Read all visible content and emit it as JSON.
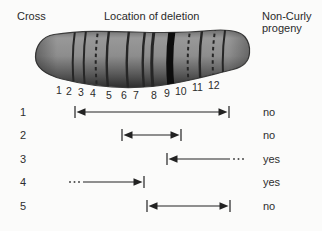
{
  "figure": {
    "background": "#fbfbfa",
    "ink": "#222222"
  },
  "headers": {
    "cross": "Cross",
    "location": "Location of deletion",
    "progeny": "Non-Curly\nprogeny"
  },
  "chromosome": {
    "outline_color": "#3c3c3c",
    "fill_top": "#989898",
    "fill_mid": "#8d8d8d",
    "fill_bottom": "#343434",
    "band_color": "#262626",
    "heavy_band_color": "#0d0d0d",
    "bands": [
      {
        "label": "1",
        "x": 74,
        "style": "solid",
        "width": 2,
        "label_x": 56,
        "label_y": 94
      },
      {
        "label": "2",
        "x": 85,
        "style": "solid",
        "width": 2,
        "label_x": 66,
        "label_y": 95
      },
      {
        "label": "3",
        "x": 97,
        "style": "dashed",
        "width": 2,
        "label_x": 78,
        "label_y": 96
      },
      {
        "label": "4",
        "x": 108,
        "style": "solid",
        "width": 2.4,
        "label_x": 90,
        "label_y": 97
      },
      {
        "label": "5",
        "x": 128,
        "style": "solid",
        "width": 2.4,
        "label_x": 106,
        "label_y": 99
      },
      {
        "label": "6",
        "x": 144,
        "style": "solid",
        "width": 2.4,
        "label_x": 121,
        "label_y": 99
      },
      {
        "label": "7",
        "x": 153,
        "style": "solid",
        "width": 3,
        "label_x": 133,
        "label_y": 99
      },
      {
        "label": "8",
        "x": 171,
        "style": "heavy",
        "width": 7,
        "label_x": 151,
        "label_y": 99
      },
      {
        "label": "9",
        "x": 189,
        "style": "dashed",
        "width": 2,
        "label_x": 164,
        "label_y": 97
      },
      {
        "label": "10",
        "x": 201,
        "style": "solid",
        "width": 2.4,
        "label_x": 175,
        "label_y": 95
      },
      {
        "label": "11",
        "x": 214,
        "style": "dashed",
        "width": 2,
        "label_x": 192,
        "label_y": 91
      },
      {
        "label": "12",
        "x": 224,
        "style": "solid",
        "width": 2,
        "label_x": 208,
        "label_y": 89
      }
    ]
  },
  "crosses": [
    {
      "label": "1",
      "result": "no",
      "arrow": {
        "y": 112,
        "x1": 75,
        "x2": 229,
        "left_end": "capped",
        "right_end": "capped"
      }
    },
    {
      "label": "2",
      "result": "no",
      "arrow": {
        "y": 135,
        "x1": 122,
        "x2": 181,
        "left_end": "capped",
        "right_end": "capped"
      }
    },
    {
      "label": "3",
      "result": "yes",
      "arrow": {
        "y": 159,
        "x1": 167,
        "x2": 230,
        "left_end": "capped",
        "right_end": "dots"
      }
    },
    {
      "label": "4",
      "result": "yes",
      "arrow": {
        "y": 182,
        "x1": 70,
        "x2": 144,
        "left_end": "dots",
        "right_end": "capped"
      }
    },
    {
      "label": "5",
      "result": "no",
      "arrow": {
        "y": 206,
        "x1": 147,
        "x2": 230,
        "left_end": "capped",
        "right_end": "capped"
      }
    }
  ]
}
